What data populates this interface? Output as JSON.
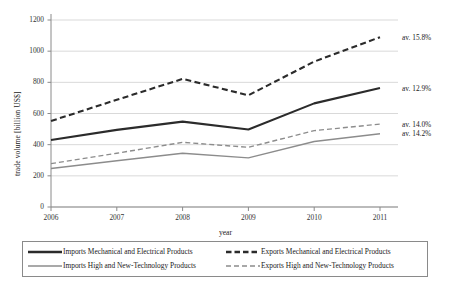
{
  "chart_data": {
    "type": "line",
    "title": "",
    "xlabel": "year",
    "ylabel": "trade volume  [billion  US$]",
    "categories": [
      "2006",
      "2007",
      "2008",
      "2009",
      "2010",
      "2011"
    ],
    "x": [
      2006,
      2007,
      2008,
      2009,
      2010,
      2011
    ],
    "xlim": [
      2006,
      2011
    ],
    "ylim": [
      0,
      1200
    ],
    "yticks": [
      0,
      200,
      400,
      600,
      800,
      1000,
      1200
    ],
    "ytick_labels": [
      "0",
      "200",
      "400",
      "600",
      "800",
      "1000",
      "1200"
    ],
    "grid": true,
    "grid_axis": "y",
    "legend_position": "bottom",
    "series": [
      {
        "name": "Imports Mechanical and Electrical Products",
        "values": [
          430,
          495,
          548,
          497,
          665,
          763
        ],
        "style": "solid",
        "color": "#2b2b2b",
        "width": 2.1
      },
      {
        "name": "Exports Mechanical and Electrical Products",
        "values": [
          552,
          688,
          822,
          717,
          933,
          1090
        ],
        "style": "dashed",
        "color": "#2b2b2b",
        "width": 2.1
      },
      {
        "name": "Imports High and New-Technology Products",
        "values": [
          247,
          297,
          345,
          315,
          420,
          470
        ],
        "style": "solid",
        "color": "#8c8c8c",
        "width": 1.4
      },
      {
        "name": "Exports High and New-Technology Products",
        "values": [
          278,
          345,
          415,
          383,
          490,
          532
        ],
        "style": "dashed",
        "color": "#8c8c8c",
        "width": 1.4
      }
    ],
    "annotations": [
      {
        "text": "av. 15.8%",
        "series": "Exports Mechanical and Electrical Products",
        "value": 1090
      },
      {
        "text": "av. 12.9%",
        "series": "Imports Mechanical and Electrical Products",
        "value": 763
      },
      {
        "text": "av. 14.0%",
        "series": "Exports High and New-Technology Products",
        "value": 532
      },
      {
        "text": "av. 14.2%",
        "series": "Imports High and New-Technology Products",
        "value": 470
      }
    ]
  },
  "legend": {
    "entries": [
      {
        "label": "Imports Mechanical and Electrical Products",
        "style": "solid",
        "color": "#2b2b2b",
        "width": 2.4
      },
      {
        "label": "Exports Mechanical and Electrical Products",
        "style": "dashed",
        "color": "#2b2b2b",
        "width": 2.4
      },
      {
        "label": "Imports High and New-Technology Products",
        "style": "solid",
        "color": "#8c8c8c",
        "width": 1.4
      },
      {
        "label": "Exports High and New-Technology Products",
        "style": "dashed",
        "color": "#8c8c8c",
        "width": 1.4
      }
    ]
  },
  "colors": {
    "dark_series": "#2b2b2b",
    "light_series": "#8c8c8c",
    "grid": "#c9c9c9",
    "axis": "#8a8a8a",
    "text": "#222222",
    "background": "#ffffff"
  }
}
